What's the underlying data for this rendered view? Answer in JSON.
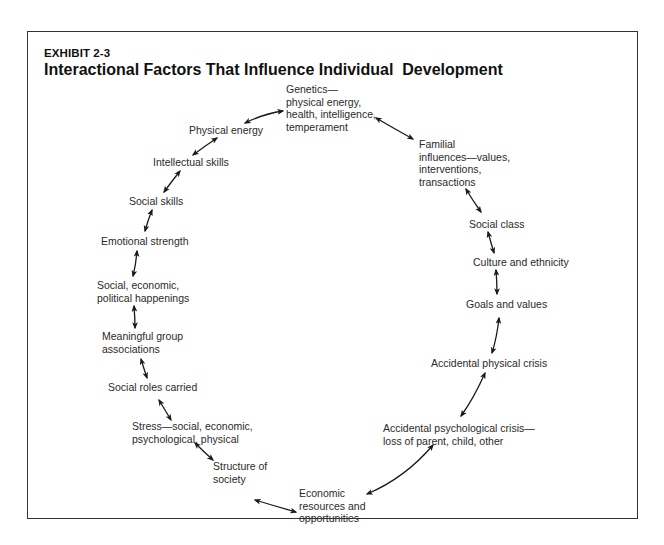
{
  "exhibit_label": "EXHIBIT 2-3",
  "title": "Interactional Factors That Influence Individual  Development",
  "nodes": [
    {
      "id": "genetics",
      "lines": [
        "Genetics—",
        "physical energy,",
        "health, intelligence,",
        "temperament"
      ]
    },
    {
      "id": "familial",
      "lines": [
        "Familial",
        "influences—values,",
        "interventions,",
        "transactions"
      ]
    },
    {
      "id": "social-class",
      "lines": [
        "Social class"
      ]
    },
    {
      "id": "culture",
      "lines": [
        "Culture and ethnicity"
      ]
    },
    {
      "id": "goals",
      "lines": [
        "Goals and values"
      ]
    },
    {
      "id": "physical-crisis",
      "lines": [
        "Accidental physical crisis"
      ]
    },
    {
      "id": "psych-crisis",
      "lines": [
        "Accidental psychological crisis—",
        "loss of parent, child, other"
      ]
    },
    {
      "id": "economic",
      "lines": [
        "Economic",
        "resources and",
        "opportunities"
      ]
    },
    {
      "id": "structure",
      "lines": [
        "Structure of",
        "society"
      ]
    },
    {
      "id": "stress",
      "lines": [
        "Stress—social, economic,",
        "psychological, physical"
      ]
    },
    {
      "id": "social-roles",
      "lines": [
        "Social roles carried"
      ]
    },
    {
      "id": "group",
      "lines": [
        "Meaningful group",
        "associations"
      ]
    },
    {
      "id": "happenings",
      "lines": [
        "Social, economic,",
        "political happenings"
      ]
    },
    {
      "id": "emotional",
      "lines": [
        "Emotional strength"
      ]
    },
    {
      "id": "social-skills",
      "lines": [
        "Social skills"
      ]
    },
    {
      "id": "intellectual",
      "lines": [
        "Intellectual skills"
      ]
    },
    {
      "id": "physical-energy",
      "lines": [
        "Physical energy"
      ]
    }
  ],
  "connections": [
    [
      "physical-energy",
      "genetics"
    ],
    [
      "genetics",
      "familial"
    ],
    [
      "familial",
      "social-class"
    ],
    [
      "social-class",
      "culture"
    ],
    [
      "culture",
      "goals"
    ],
    [
      "goals",
      "physical-crisis"
    ],
    [
      "physical-crisis",
      "psych-crisis"
    ],
    [
      "psych-crisis",
      "economic"
    ],
    [
      "economic",
      "structure"
    ],
    [
      "structure",
      "stress"
    ],
    [
      "stress",
      "social-roles"
    ],
    [
      "social-roles",
      "group"
    ],
    [
      "group",
      "happenings"
    ],
    [
      "happenings",
      "emotional"
    ],
    [
      "emotional",
      "social-skills"
    ],
    [
      "social-skills",
      "intellectual"
    ],
    [
      "intellectual",
      "physical-energy"
    ]
  ],
  "arrow_type": "bidirectional"
}
